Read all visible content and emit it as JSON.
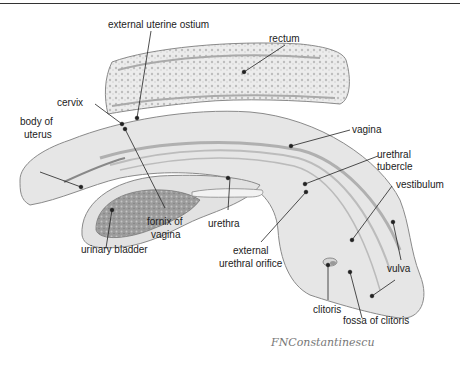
{
  "figure": {
    "signature": "FNConstantinescu",
    "colors": {
      "tissue": "#e4e4e4",
      "outline": "#8a8a8a",
      "dark": "#9a9a9a",
      "leader": "#222222"
    },
    "labels": {
      "external_uterine_ostium": "external uterine ostium",
      "rectum": "rectum",
      "cervix": "cervix",
      "body_of_uterus_1": "body of",
      "body_of_uterus_2": "uterus",
      "vagina": "vagina",
      "urethral_tubercle_1": "urethral",
      "urethral_tubercle_2": "tubercle",
      "vestibulum": "vestibulum",
      "urethra": "urethra",
      "fornix_of_vagina_1": "fornix of",
      "fornix_of_vagina_2": "vagina",
      "urinary_bladder": "urinary bladder",
      "external_urethral_orifice_1": "external",
      "external_urethral_orifice_2": "urethral orifice",
      "vulva": "vulva",
      "clitoris": "clitoris",
      "fossa_of_clitoris": "fossa of clitoris"
    }
  }
}
